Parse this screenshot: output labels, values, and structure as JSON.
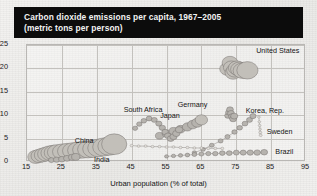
{
  "title": {
    "line1": "Carbon dioxide emissions per capita, 1967–2005",
    "line2": "(metric tons per person)"
  },
  "chart_data": {
    "type": "scatter",
    "title": "Carbon dioxide emissions per capita, 1967–2005 (metric tons per person)",
    "xlabel": "Urban population (% of total)",
    "ylabel": "",
    "xlim": [
      15,
      95
    ],
    "ylim": [
      0,
      25
    ],
    "xticks": [
      15,
      25,
      35,
      45,
      55,
      65,
      75,
      85,
      95
    ],
    "yticks": [
      0,
      5,
      10,
      15,
      20,
      25
    ],
    "grid": true,
    "legend": "inline-labels",
    "note": "Connected bubble trails, one per country, tracing 1967–2005; bubble size encodes population.",
    "series": [
      {
        "name": "United States",
        "label_x": 81,
        "label_y": 23.6,
        "points": [
          {
            "x": 72.5,
            "y": 19.9,
            "r": 7.8
          },
          {
            "x": 73.2,
            "y": 21.2,
            "r": 7.9
          },
          {
            "x": 73.6,
            "y": 20.2,
            "r": 8.0
          },
          {
            "x": 74.1,
            "y": 19.1,
            "r": 8.1
          },
          {
            "x": 74.6,
            "y": 19.6,
            "r": 8.3
          },
          {
            "x": 75.2,
            "y": 20.1,
            "r": 8.5
          },
          {
            "x": 75.9,
            "y": 19.8,
            "r": 8.8
          },
          {
            "x": 76.8,
            "y": 19.5,
            "r": 9.4
          },
          {
            "x": 78.2,
            "y": 19.6,
            "r": 10.6
          }
        ]
      },
      {
        "name": "Germany",
        "label_x": 58.5,
        "label_y": 11.9,
        "points": [
          {
            "x": 72.6,
            "y": 9.9,
            "r": 3.2
          },
          {
            "x": 72.9,
            "y": 10.6,
            "r": 3.3
          },
          {
            "x": 73.2,
            "y": 11.2,
            "r": 3.4
          },
          {
            "x": 73.5,
            "y": 10.4,
            "r": 3.4
          },
          {
            "x": 73.8,
            "y": 9.7,
            "r": 3.5
          },
          {
            "x": 74.1,
            "y": 9.2,
            "r": 3.5
          },
          {
            "x": 74.4,
            "y": 9.8,
            "r": 3.6
          }
        ]
      },
      {
        "name": "Japan",
        "label_x": 53.5,
        "label_y": 9.6,
        "points": [
          {
            "x": 53.0,
            "y": 5.6,
            "r": 4.1
          },
          {
            "x": 55.0,
            "y": 6.1,
            "r": 4.3
          },
          {
            "x": 57.0,
            "y": 6.6,
            "r": 4.5
          },
          {
            "x": 59.0,
            "y": 7.0,
            "r": 4.7
          },
          {
            "x": 61.0,
            "y": 7.5,
            "r": 5.0
          },
          {
            "x": 62.5,
            "y": 8.0,
            "r": 5.2
          },
          {
            "x": 63.8,
            "y": 8.4,
            "r": 5.5
          },
          {
            "x": 65.0,
            "y": 9.0,
            "r": 6.2
          }
        ]
      },
      {
        "name": "South Africa",
        "label_x": 43,
        "label_y": 10.8,
        "points": [
          {
            "x": 46.0,
            "y": 7.2,
            "r": 2.6
          },
          {
            "x": 47.2,
            "y": 8.1,
            "r": 2.7
          },
          {
            "x": 48.5,
            "y": 8.8,
            "r": 2.8
          },
          {
            "x": 50.0,
            "y": 9.3,
            "r": 2.9
          },
          {
            "x": 51.5,
            "y": 9.0,
            "r": 3.0
          },
          {
            "x": 52.8,
            "y": 8.2,
            "r": 3.1
          },
          {
            "x": 53.8,
            "y": 7.3,
            "r": 3.2
          },
          {
            "x": 54.6,
            "y": 6.4,
            "r": 3.3
          },
          {
            "x": 55.4,
            "y": 5.6,
            "r": 3.4
          },
          {
            "x": 56.2,
            "y": 5.0,
            "r": 3.5
          },
          {
            "x": 57.0,
            "y": 5.4,
            "r": 3.6
          },
          {
            "x": 57.8,
            "y": 6.1,
            "r": 3.7
          },
          {
            "x": 58.6,
            "y": 6.9,
            "r": 3.8
          }
        ]
      },
      {
        "name": "Korea, Rep.",
        "label_x": 78,
        "label_y": 10.6,
        "points": [
          {
            "x": 63.0,
            "y": 2.0,
            "r": 2.2
          },
          {
            "x": 65.5,
            "y": 2.7,
            "r": 2.3
          },
          {
            "x": 68.0,
            "y": 3.6,
            "r": 2.4
          },
          {
            "x": 70.5,
            "y": 4.5,
            "r": 2.5
          },
          {
            "x": 72.5,
            "y": 5.4,
            "r": 2.6
          },
          {
            "x": 74.5,
            "y": 6.4,
            "r": 2.7
          },
          {
            "x": 76.0,
            "y": 7.3,
            "r": 2.8
          },
          {
            "x": 77.5,
            "y": 8.2,
            "r": 2.9
          },
          {
            "x": 78.8,
            "y": 9.0,
            "r": 3.0
          },
          {
            "x": 79.8,
            "y": 9.8,
            "r": 3.1
          }
        ]
      },
      {
        "name": "Sweden",
        "label_x": 84,
        "label_y": 6.2,
        "points": [
          {
            "x": 81.5,
            "y": 9.6,
            "r": 1.4
          },
          {
            "x": 81.6,
            "y": 8.6,
            "r": 1.4
          },
          {
            "x": 81.7,
            "y": 7.8,
            "r": 1.4
          },
          {
            "x": 81.8,
            "y": 7.0,
            "r": 1.4
          },
          {
            "x": 81.9,
            "y": 6.3,
            "r": 1.5
          },
          {
            "x": 82.0,
            "y": 5.7,
            "r": 1.5
          }
        ]
      },
      {
        "name": "China",
        "label_x": 29,
        "label_y": 4.2,
        "points": [
          {
            "x": 17.5,
            "y": 1.1,
            "r": 8.0
          },
          {
            "x": 18.5,
            "y": 1.3,
            "r": 8.2
          },
          {
            "x": 19.5,
            "y": 1.5,
            "r": 8.4
          },
          {
            "x": 20.5,
            "y": 1.7,
            "r": 8.6
          },
          {
            "x": 21.5,
            "y": 1.9,
            "r": 8.8
          },
          {
            "x": 22.5,
            "y": 2.0,
            "r": 9.0
          },
          {
            "x": 23.5,
            "y": 2.1,
            "r": 9.2
          },
          {
            "x": 25.0,
            "y": 2.2,
            "r": 9.4
          },
          {
            "x": 26.5,
            "y": 2.3,
            "r": 9.6
          },
          {
            "x": 28.0,
            "y": 2.4,
            "r": 9.8
          },
          {
            "x": 29.5,
            "y": 2.5,
            "r": 10.0
          },
          {
            "x": 31.0,
            "y": 2.6,
            "r": 10.2
          },
          {
            "x": 32.5,
            "y": 2.7,
            "r": 10.4
          },
          {
            "x": 34.0,
            "y": 2.8,
            "r": 10.6
          },
          {
            "x": 35.5,
            "y": 3.0,
            "r": 10.8
          },
          {
            "x": 37.0,
            "y": 3.2,
            "r": 11.0
          },
          {
            "x": 38.5,
            "y": 3.4,
            "r": 11.2
          },
          {
            "x": 40.0,
            "y": 3.8,
            "r": 12.6
          }
        ]
      },
      {
        "name": "India",
        "label_x": 34.5,
        "label_y": 0.3,
        "points": [
          {
            "x": 22.0,
            "y": 0.4,
            "r": 3.0
          },
          {
            "x": 23.5,
            "y": 0.5,
            "r": 3.2
          },
          {
            "x": 25.0,
            "y": 0.6,
            "r": 3.4
          },
          {
            "x": 26.5,
            "y": 0.8,
            "r": 3.6
          },
          {
            "x": 28.0,
            "y": 1.0,
            "r": 3.9
          },
          {
            "x": 29.0,
            "y": 1.1,
            "r": 4.2
          }
        ]
      },
      {
        "name": "Brazil",
        "label_x": 86.5,
        "label_y": 2.0,
        "points": [
          {
            "x": 55.0,
            "y": 1.2,
            "r": 2.0
          },
          {
            "x": 57.0,
            "y": 1.3,
            "r": 2.1
          },
          {
            "x": 59.0,
            "y": 1.4,
            "r": 2.2
          },
          {
            "x": 61.0,
            "y": 1.5,
            "r": 2.3
          },
          {
            "x": 63.0,
            "y": 1.6,
            "r": 2.4
          },
          {
            "x": 65.0,
            "y": 1.7,
            "r": 2.5
          },
          {
            "x": 67.0,
            "y": 1.8,
            "r": 2.6
          },
          {
            "x": 69.0,
            "y": 1.8,
            "r": 2.7
          },
          {
            "x": 71.0,
            "y": 1.9,
            "r": 2.8
          },
          {
            "x": 73.0,
            "y": 1.9,
            "r": 2.9
          },
          {
            "x": 75.0,
            "y": 2.0,
            "r": 3.0
          },
          {
            "x": 77.0,
            "y": 2.0,
            "r": 3.1
          },
          {
            "x": 79.0,
            "y": 2.0,
            "r": 3.2
          },
          {
            "x": 81.0,
            "y": 2.0,
            "r": 3.3
          },
          {
            "x": 83.0,
            "y": 2.1,
            "r": 3.4
          }
        ]
      },
      {
        "name": "unlabeled-mid-trail",
        "label_x": null,
        "label_y": null,
        "points": [
          {
            "x": 45.0,
            "y": 3.5,
            "r": 1.5
          },
          {
            "x": 47.0,
            "y": 3.4,
            "r": 1.5
          },
          {
            "x": 49.0,
            "y": 3.4,
            "r": 1.5
          },
          {
            "x": 51.0,
            "y": 3.3,
            "r": 1.5
          },
          {
            "x": 53.0,
            "y": 3.3,
            "r": 1.5
          },
          {
            "x": 55.0,
            "y": 3.2,
            "r": 1.5
          },
          {
            "x": 57.0,
            "y": 3.2,
            "r": 1.5
          },
          {
            "x": 59.0,
            "y": 3.1,
            "r": 1.5
          },
          {
            "x": 61.0,
            "y": 3.1,
            "r": 1.5
          },
          {
            "x": 63.0,
            "y": 3.0,
            "r": 1.5
          },
          {
            "x": 65.0,
            "y": 3.0,
            "r": 1.5
          },
          {
            "x": 67.0,
            "y": 2.9,
            "r": 1.5
          },
          {
            "x": 69.0,
            "y": 2.9,
            "r": 1.5
          },
          {
            "x": 71.0,
            "y": 2.9,
            "r": 1.5
          }
        ]
      }
    ]
  }
}
